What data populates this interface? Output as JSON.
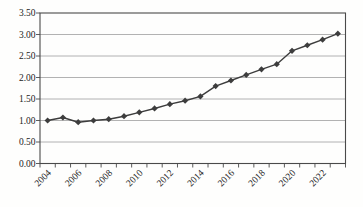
{
  "figure": {
    "background_color": "#fefefd"
  },
  "chart_data": {
    "type": "line",
    "title": "",
    "xlabel": "",
    "ylabel": "",
    "x": [
      "2004",
      "2005",
      "2006",
      "2007",
      "2008",
      "2009",
      "2010",
      "2011",
      "2012",
      "2013",
      "2014",
      "2015",
      "2016",
      "2017",
      "2018",
      "2019",
      "2020",
      "2021",
      "2022",
      "2023"
    ],
    "series": [
      {
        "name": "index-line",
        "values": [
          1.0,
          1.07,
          0.96,
          1.0,
          1.03,
          1.1,
          1.19,
          1.28,
          1.38,
          1.46,
          1.56,
          1.8,
          1.93,
          2.06,
          2.19,
          2.31,
          2.62,
          2.75,
          2.88,
          3.02
        ],
        "color": "#3d3d3d",
        "marker": "diamond"
      }
    ],
    "ylim": [
      0,
      3.5
    ],
    "ytick_step": 0.5,
    "ytick_labels": [
      "0.00",
      "0.50",
      "1.00",
      "1.50",
      "2.00",
      "2.50",
      "3.00",
      "3.50"
    ],
    "xtick_labels": [
      "2004",
      "2006",
      "2008",
      "2010",
      "2012",
      "2014",
      "2016",
      "2018",
      "2020",
      "2022"
    ],
    "xtick_label_every": 2,
    "xtick_label_rotation": -45,
    "grid": "horizontal",
    "legend": "none",
    "plot_border": true,
    "colors": {
      "axis": "#4a4a4a",
      "grid": "#9e9e9e",
      "text": "#1c1c1c",
      "line": "#3d3d3d"
    }
  }
}
